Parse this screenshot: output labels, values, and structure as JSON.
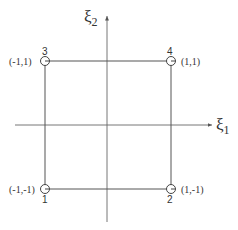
{
  "diagram": {
    "type": "reference-square-element",
    "axes": {
      "horizontal": {
        "symbol": "ξ",
        "subscript": "1"
      },
      "vertical": {
        "symbol": "ξ",
        "subscript": "2"
      }
    },
    "nodes": [
      {
        "id": "1",
        "coords": "(-1,-1)"
      },
      {
        "id": "2",
        "coords": "(1,-1)"
      },
      {
        "id": "3",
        "coords": "(-1,1)"
      },
      {
        "id": "4",
        "coords": "(1,1)"
      }
    ],
    "colors": {
      "line": "#555555",
      "text": "#333333",
      "background": "#ffffff"
    }
  }
}
